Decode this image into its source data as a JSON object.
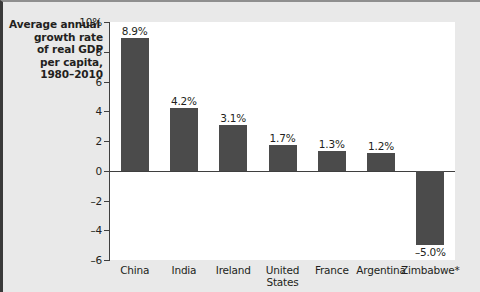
{
  "chart_data": {
    "type": "bar",
    "title": "Average annual growth rate of real GDP per capita, 1980–2010",
    "title_lines": [
      "Average annual",
      "growth rate",
      "of real GDP",
      "per capita,",
      "1980–2010"
    ],
    "xlabel": "",
    "ylabel": "",
    "ylim": [
      -6,
      10
    ],
    "grid": false,
    "legend": null,
    "bar_color": "#4b4b4b",
    "plot_background": "#ffffff",
    "figure_background": "#e9e9e9",
    "text_color": "#231f20",
    "axis_color": "#3f3f3f",
    "ytick_values": [
      10,
      8,
      6,
      4,
      2,
      0,
      -2,
      -4,
      -6
    ],
    "ytick_labels": [
      "10%",
      "8",
      "6",
      "4",
      "2",
      "0",
      "–2",
      "–4",
      "–6"
    ],
    "categories": [
      "China",
      "India",
      "Ireland",
      "United States",
      "France",
      "Argentina",
      "Zimbabwe*"
    ],
    "category_label_lines": [
      [
        "China"
      ],
      [
        "India"
      ],
      [
        "Ireland"
      ],
      [
        "United",
        "States"
      ],
      [
        "France"
      ],
      [
        "Argentina"
      ],
      [
        "Zimbabwe*"
      ]
    ],
    "values": [
      8.9,
      4.2,
      3.1,
      1.7,
      1.3,
      1.2,
      -5.0
    ],
    "value_labels": [
      "8.9%",
      "4.2%",
      "3.1%",
      "1.7%",
      "1.3%",
      "1.2%",
      "–5.0%"
    ]
  }
}
